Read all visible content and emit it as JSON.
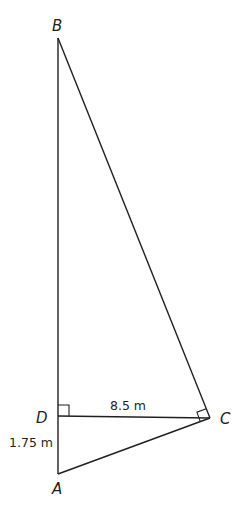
{
  "diagram": {
    "type": "right-triangle-geometry",
    "vertices": {
      "B": {
        "label": "B",
        "x": 58,
        "y": 38
      },
      "D": {
        "label": "D",
        "x": 58,
        "y": 416
      },
      "C": {
        "label": "C",
        "x": 210,
        "y": 418
      },
      "A": {
        "label": "A",
        "x": 58,
        "y": 474
      }
    },
    "segments": [
      {
        "from": "B",
        "to": "A"
      },
      {
        "from": "B",
        "to": "C"
      },
      {
        "from": "D",
        "to": "C"
      },
      {
        "from": "A",
        "to": "C"
      }
    ],
    "right_angles": [
      "D",
      "C"
    ],
    "measurements": {
      "DC": "8.5 m",
      "DA": "1.75 m"
    },
    "stroke_color": "#231f20"
  }
}
